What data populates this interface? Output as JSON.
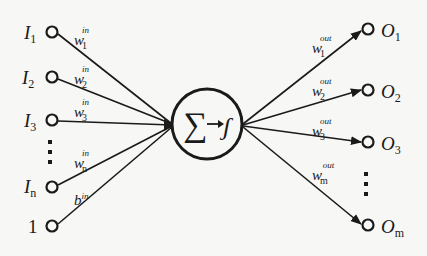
{
  "diagram": {
    "inputs": [
      {
        "label": "I",
        "sub": "1",
        "weight": "w",
        "weight_sub": "1",
        "weight_sup": "in"
      },
      {
        "label": "I",
        "sub": "2",
        "weight": "w",
        "weight_sub": "2",
        "weight_sup": "in"
      },
      {
        "label": "I",
        "sub": "3",
        "weight": "w",
        "weight_sub": "3",
        "weight_sup": "in"
      },
      {
        "label": "I",
        "sub": "n",
        "weight": "w",
        "weight_sub": "n",
        "weight_sup": "in"
      },
      {
        "label": "1",
        "sub": "",
        "weight": "b",
        "weight_sub": "",
        "weight_sup": "in"
      }
    ],
    "neuron": {
      "label": "∑→f"
    },
    "outputs": [
      {
        "label": "O",
        "sub": "1",
        "weight": "w",
        "weight_sub": "1",
        "weight_sup": "out"
      },
      {
        "label": "O",
        "sub": "2",
        "weight": "w",
        "weight_sub": "2",
        "weight_sup": "out"
      },
      {
        "label": "O",
        "sub": "3",
        "weight": "w",
        "weight_sub": "3",
        "weight_sup": "out"
      },
      {
        "label": "O",
        "sub": "m",
        "weight": "w",
        "weight_sub": "m",
        "weight_sup": "out"
      }
    ],
    "ellipsis_icon": "vertical-dots",
    "colors": {
      "ink": "#1a1a1a",
      "background": "#f7f7f5"
    }
  }
}
